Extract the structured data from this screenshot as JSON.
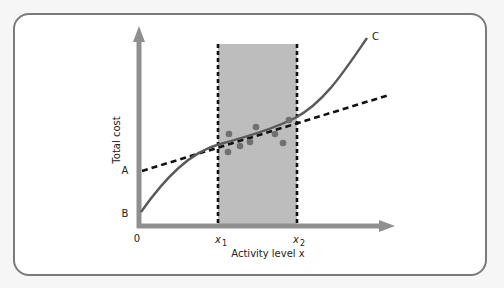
{
  "diagram": {
    "y_axis_label": "Total cost",
    "x_axis_label": "Activity level x",
    "origin_label": "0",
    "point_labels": {
      "a": "A",
      "b": "B",
      "c": "C"
    },
    "x_markers": {
      "x1": "x",
      "x1_sub": "1",
      "x2": "x",
      "x2_sub": "2"
    },
    "colors": {
      "axis": "#8a8a8a",
      "shaded_region": "#bdbdbd",
      "curve": "#555555",
      "dashed_line": "#111111",
      "points": "#6f6f6f",
      "frame_border": "#7a7a7a"
    },
    "elements": {
      "curve_c": "Nonlinear total cost curve from B to C",
      "line_a": "Dashed linear approximation starting at A",
      "relevant_range": "Shaded band between x1 and x2",
      "observations": 8
    }
  }
}
